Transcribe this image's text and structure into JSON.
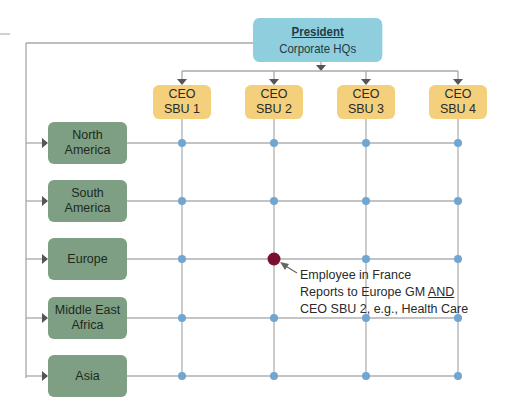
{
  "president": {
    "title": "President",
    "subtitle": "Corporate HQs"
  },
  "ceos": [
    {
      "line1": "CEO",
      "line2": "SBU 1"
    },
    {
      "line1": "CEO",
      "line2": "SBU 2"
    },
    {
      "line1": "CEO",
      "line2": "SBU 3"
    },
    {
      "line1": "CEO",
      "line2": "SBU 4"
    }
  ],
  "regions": [
    {
      "line1": "North",
      "line2": "America"
    },
    {
      "line1": "South",
      "line2": "America"
    },
    {
      "line1": "Europe",
      "line2": ""
    },
    {
      "line1": "Middle East",
      "line2": "Africa"
    },
    {
      "line1": "Asia",
      "line2": ""
    }
  ],
  "callout": {
    "line1": "Employee in France",
    "line2_prefix": "Reports to Europe GM ",
    "line2_emph": "AND",
    "line3": "CEO SBU 2, e.g., Health Care"
  },
  "colors": {
    "president": "#8fcfdd",
    "ceo": "#f4cf7c",
    "region": "#7e9f83",
    "node": "#6fa6d2",
    "highlight_node": "#7a1030",
    "line": "#a8a8a8"
  }
}
